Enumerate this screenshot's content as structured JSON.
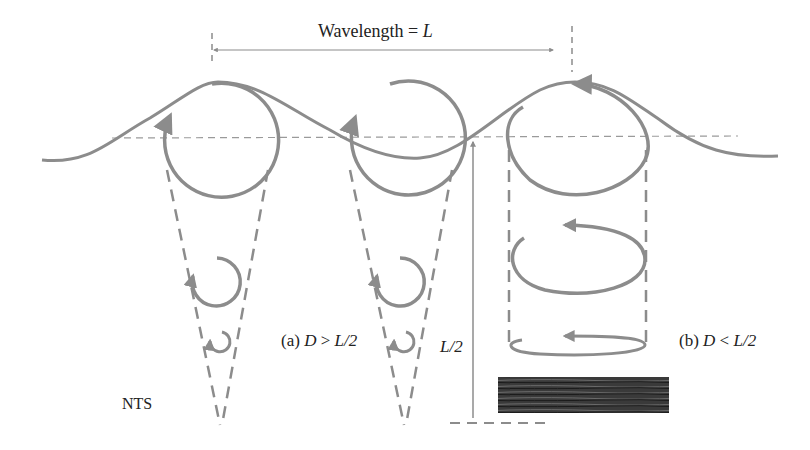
{
  "diagram": {
    "title_label": "Wavelength",
    "title_eq": " = ",
    "title_var": "L",
    "label_a_prefix": "(a) ",
    "label_a_d": "D",
    "label_a_op": " > ",
    "label_a_rhs": "L/2",
    "label_b_prefix": "(b) ",
    "label_b_d": "D",
    "label_b_op": " < ",
    "label_b_rhs": "L/2",
    "depth_label": "L/2",
    "scale_note": "NTS",
    "colors": {
      "stroke": "#8c8c8c",
      "text": "#222222",
      "seabed": "#3a3a3a",
      "background": "#ffffff"
    },
    "cases": [
      {
        "id": "a1",
        "type": "deep-water",
        "orbits": "circular, decreasing with depth"
      },
      {
        "id": "a2",
        "type": "deep-water",
        "orbits": "circular, decreasing with depth"
      },
      {
        "id": "b",
        "type": "shallow-water",
        "orbits": "elliptical, flattening with depth"
      }
    ]
  }
}
